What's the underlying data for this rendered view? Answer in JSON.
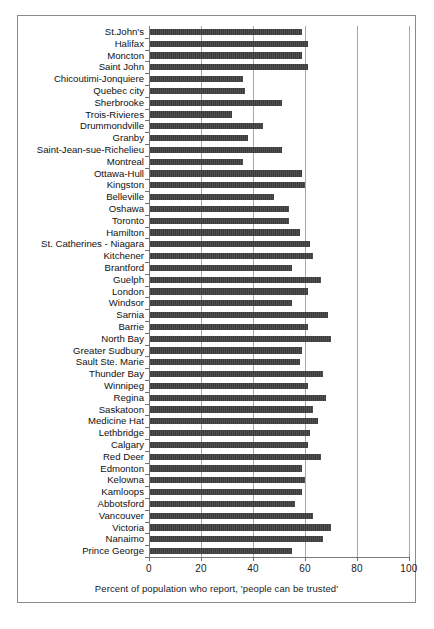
{
  "chart_data": {
    "type": "bar",
    "orientation": "horizontal",
    "title": "",
    "xlabel": "Percent of population who report,  'people can be trusted'",
    "ylabel": "",
    "xlim": [
      0,
      100
    ],
    "xticks": [
      0,
      20,
      40,
      60,
      80,
      100
    ],
    "grid": true,
    "legend": false,
    "bar_color": "#474747",
    "categories": [
      "St.John's",
      "Halifax",
      "Moncton",
      "Saint John",
      "Chicoutimi-Jonquiere",
      "Quebec city",
      "Sherbrooke",
      "Trois-Rivieres",
      "Drummondville",
      "Granby",
      "Saint-Jean-sue-Richelieu",
      "Montreal",
      "Ottawa-Hull",
      "Kingston",
      "Belleville",
      "Oshawa",
      "Toronto",
      "Hamilton",
      "St. Catherines - Niagara",
      "Kitchener",
      "Brantford",
      "Guelph",
      "London",
      "Windsor",
      "Sarnia",
      "Barrie",
      "North Bay",
      "Greater Sudbury",
      "Sault Ste. Marie",
      "Thunder Bay",
      "Winnipeg",
      "Regina",
      "Saskatoon",
      "Medicine Hat",
      "Lethbridge",
      "Calgary",
      "Red Deer",
      "Edmonton",
      "Kelowna",
      "Kamloops",
      "Abbotsford",
      "Vancouver",
      "Victoria",
      "Nanaimo",
      "Prince George"
    ],
    "values": [
      59,
      61,
      59,
      61,
      36,
      37,
      51,
      32,
      44,
      38,
      51,
      36,
      59,
      60,
      48,
      54,
      54,
      58,
      62,
      63,
      55,
      66,
      61,
      55,
      69,
      61,
      70,
      59,
      58,
      67,
      61,
      68,
      63,
      65,
      62,
      61,
      66,
      59,
      60,
      59,
      56,
      63,
      70,
      67,
      55
    ]
  },
  "axis": {
    "tick_labels": [
      "0",
      "20",
      "40",
      "60",
      "80",
      "100"
    ]
  }
}
